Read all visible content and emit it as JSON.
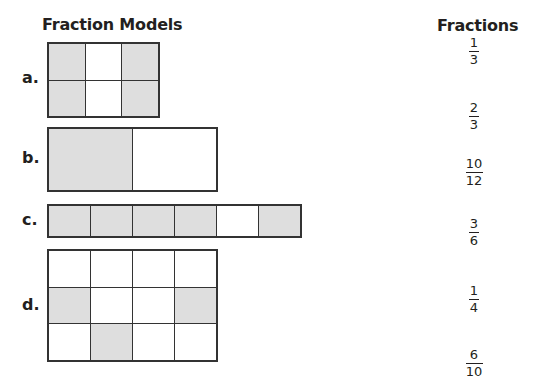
{
  "headings": {
    "models": "Fraction Models",
    "fractions": "Fractions"
  },
  "colors": {
    "shaded": "#dedede",
    "unshaded": "#ffffff",
    "grid_line": "#333333",
    "text": "#231f20"
  },
  "models": [
    {
      "label": "a.",
      "rows": 2,
      "cols": 3,
      "shaded_cells": [
        [
          0,
          0
        ],
        [
          0,
          2
        ],
        [
          1,
          0
        ],
        [
          1,
          2
        ]
      ],
      "shaded_count": 4,
      "total_cells": 6
    },
    {
      "label": "b.",
      "rows": 1,
      "cols": 2,
      "shaded_cells": [
        [
          0,
          0
        ]
      ],
      "shaded_count": 1,
      "total_cells": 2
    },
    {
      "label": "c.",
      "rows": 1,
      "cols": 6,
      "shaded_cells": [
        [
          0,
          0
        ],
        [
          0,
          1
        ],
        [
          0,
          2
        ],
        [
          0,
          3
        ],
        [
          0,
          5
        ]
      ],
      "shaded_count": 5,
      "total_cells": 6
    },
    {
      "label": "d.",
      "rows": 3,
      "cols": 4,
      "shaded_cells": [
        [
          1,
          0
        ],
        [
          1,
          3
        ],
        [
          2,
          1
        ]
      ],
      "shaded_count": 3,
      "total_cells": 12
    }
  ],
  "fractions": [
    {
      "numerator": "1",
      "denominator": "3"
    },
    {
      "numerator": "2",
      "denominator": "3"
    },
    {
      "numerator": "10",
      "denominator": "12"
    },
    {
      "numerator": "3",
      "denominator": "6"
    },
    {
      "numerator": "1",
      "denominator": "4"
    },
    {
      "numerator": "6",
      "denominator": "10"
    }
  ]
}
